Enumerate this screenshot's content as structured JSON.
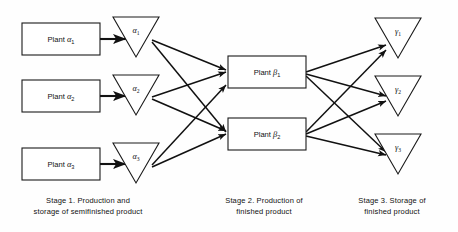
{
  "figure": {
    "type": "process-flow-diagram",
    "background_color": "#fefefe",
    "line_color": "#111111",
    "shape_fill": "#ffffff"
  },
  "stages": [
    {
      "id": "stage-1",
      "caption": "Stage 1.  Production and\nstorage of semifinished product"
    },
    {
      "id": "stage-2",
      "caption": "Stage 2.  Production of\nfinished product"
    },
    {
      "id": "stage-3",
      "caption": "Stage 3.  Storage of\nfinished product"
    }
  ],
  "nodes": {
    "plant_alpha": [
      {
        "id": "plant-alpha-1",
        "text": "Plant",
        "greek": "α",
        "sub": "1",
        "x": 22,
        "y": 23,
        "w": 78,
        "h": 32
      },
      {
        "id": "plant-alpha-2",
        "text": "Plant",
        "greek": "α",
        "sub": "2",
        "x": 22,
        "y": 80,
        "w": 78,
        "h": 32
      },
      {
        "id": "plant-alpha-3",
        "text": "Plant",
        "greek": "α",
        "sub": "3",
        "x": 22,
        "y": 148,
        "w": 78,
        "h": 32
      }
    ],
    "storage_alpha": [
      {
        "id": "storage-alpha-1",
        "greek": "α",
        "sub": "1",
        "cx": 136,
        "top": 17,
        "half": 23,
        "h": 40
      },
      {
        "id": "storage-alpha-2",
        "greek": "α",
        "sub": "2",
        "cx": 136,
        "top": 75,
        "half": 23,
        "h": 40
      },
      {
        "id": "storage-alpha-3",
        "greek": "α",
        "sub": "3",
        "cx": 136,
        "top": 143,
        "half": 23,
        "h": 40
      }
    ],
    "plant_beta": [
      {
        "id": "plant-beta-1",
        "text": "Plant",
        "greek": "β",
        "sub": "1",
        "x": 228,
        "y": 56,
        "w": 78,
        "h": 32
      },
      {
        "id": "plant-beta-2",
        "text": "Plant",
        "greek": "β",
        "sub": "2",
        "x": 228,
        "y": 118,
        "w": 78,
        "h": 32
      }
    ],
    "storage_gamma": [
      {
        "id": "storage-gamma-1",
        "greek": "γ",
        "sub": "1",
        "cx": 398,
        "top": 18,
        "half": 23,
        "h": 40
      },
      {
        "id": "storage-gamma-2",
        "greek": "γ",
        "sub": "2",
        "cx": 398,
        "top": 76,
        "half": 23,
        "h": 40
      },
      {
        "id": "storage-gamma-3",
        "greek": "γ",
        "sub": "3",
        "cx": 398,
        "top": 134,
        "half": 23,
        "h": 40
      }
    ]
  },
  "edges": {
    "plant_to_storage": [
      {
        "id": "edge-plant-alpha-1-storage-alpha-1",
        "x1": 100,
        "y1": 39,
        "x2": 126,
        "y2": 39
      },
      {
        "id": "edge-plant-alpha-2-storage-alpha-2",
        "x1": 100,
        "y1": 96,
        "x2": 126,
        "y2": 96
      },
      {
        "id": "edge-plant-alpha-3-storage-alpha-3",
        "x1": 100,
        "y1": 164,
        "x2": 126,
        "y2": 164
      }
    ],
    "storage_alpha_to_plant_beta": [
      {
        "id": "edge-storage-alpha-1-plant-beta-1",
        "x1": 152,
        "y1": 40,
        "x2": 226,
        "y2": 70
      },
      {
        "id": "edge-storage-alpha-1-plant-beta-2",
        "x1": 152,
        "y1": 42,
        "x2": 226,
        "y2": 132
      },
      {
        "id": "edge-storage-alpha-2-plant-beta-1",
        "x1": 152,
        "y1": 97,
        "x2": 226,
        "y2": 72
      },
      {
        "id": "edge-storage-alpha-2-plant-beta-2",
        "x1": 152,
        "y1": 99,
        "x2": 226,
        "y2": 131
      },
      {
        "id": "edge-storage-alpha-3-plant-beta-1",
        "x1": 152,
        "y1": 165,
        "x2": 226,
        "y2": 85
      },
      {
        "id": "edge-storage-alpha-3-plant-beta-2",
        "x1": 152,
        "y1": 167,
        "x2": 226,
        "y2": 134
      }
    ],
    "plant_beta_to_storage_gamma": [
      {
        "id": "edge-plant-beta-1-storage-gamma-1",
        "x1": 306,
        "y1": 72,
        "x2": 386,
        "y2": 45
      },
      {
        "id": "edge-plant-beta-1-storage-gamma-2",
        "x1": 306,
        "y1": 74,
        "x2": 386,
        "y2": 96
      },
      {
        "id": "edge-plant-beta-1-storage-gamma-3",
        "x1": 306,
        "y1": 76,
        "x2": 386,
        "y2": 152
      },
      {
        "id": "edge-plant-beta-2-storage-gamma-1",
        "x1": 306,
        "y1": 132,
        "x2": 386,
        "y2": 50
      },
      {
        "id": "edge-plant-beta-2-storage-gamma-2",
        "x1": 306,
        "y1": 134,
        "x2": 386,
        "y2": 101
      },
      {
        "id": "edge-plant-beta-2-storage-gamma-3",
        "x1": 306,
        "y1": 136,
        "x2": 386,
        "y2": 155
      }
    ]
  }
}
